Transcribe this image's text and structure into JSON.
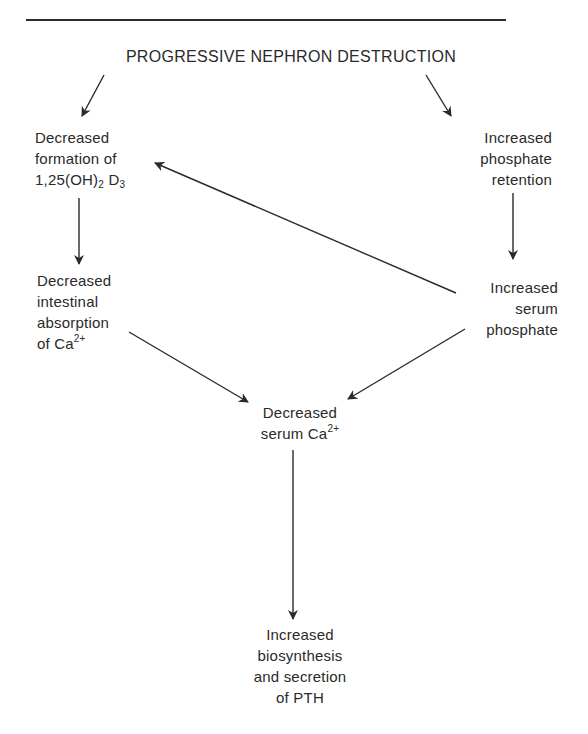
{
  "diagram": {
    "title": "PROGRESSIVE NEPHRON DESTRUCTION",
    "nodes": {
      "decreased_formation": {
        "line1": "Decreased",
        "line2": "formation of",
        "line3_prefix": "1,25(OH)",
        "line3_sub1": "2",
        "line3_mid": " D",
        "line3_sub2": "3"
      },
      "increased_phosphate_retention": {
        "line1": "Increased",
        "line2": "phosphate",
        "line3": "retention"
      },
      "decreased_intestinal_absorption": {
        "line1": "Decreased",
        "line2": "intestinal",
        "line3": "absorption",
        "line4_prefix": "of Ca",
        "line4_sup": "2+"
      },
      "increased_serum_phosphate": {
        "line1": "Increased",
        "line2": "serum",
        "line3": "phosphate"
      },
      "decreased_serum_calcium": {
        "line1": "Decreased",
        "line2_prefix": "serum Ca",
        "line2_sup": "2+"
      },
      "increased_pth": {
        "line1": "Increased",
        "line2": "biosynthesis",
        "line3": "and secretion",
        "line4": "of PTH"
      }
    },
    "edges": [
      {
        "from": "PROGRESSIVE NEPHRON DESTRUCTION",
        "to": "Decreased formation of 1,25(OH)2D3"
      },
      {
        "from": "PROGRESSIVE NEPHRON DESTRUCTION",
        "to": "Increased phosphate retention"
      },
      {
        "from": "Decreased formation of 1,25(OH)2D3",
        "to": "Decreased intestinal absorption of Ca2+"
      },
      {
        "from": "Increased phosphate retention",
        "to": "Increased serum phosphate"
      },
      {
        "from": "Increased serum phosphate",
        "to": "Decreased formation of 1,25(OH)2D3"
      },
      {
        "from": "Decreased intestinal absorption of Ca2+",
        "to": "Decreased serum Ca2+"
      },
      {
        "from": "Increased serum phosphate",
        "to": "Decreased serum Ca2+"
      },
      {
        "from": "Decreased serum Ca2+",
        "to": "Increased biosynthesis and secretion of PTH"
      }
    ],
    "colors": {
      "ink": "#2a2a2a",
      "background": "#ffffff"
    }
  }
}
